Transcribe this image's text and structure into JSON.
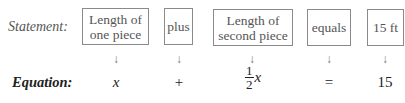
{
  "statement_label": "Statement:",
  "equation_label": "Equation:",
  "boxes": [
    {
      "line1": "Length of",
      "line2": "one piece"
    },
    {
      "line1": "plus",
      "line2": ""
    },
    {
      "line1": "Length of",
      "line2": "second piece"
    },
    {
      "line1": "equals",
      "line2": ""
    },
    {
      "line1": "15 ft",
      "line2": ""
    }
  ],
  "arrow_glyph": "↓",
  "equation": {
    "term1": "x",
    "op1": "+",
    "term2_num": "1",
    "term2_den": "2",
    "term2_var": "x",
    "op2": "=",
    "rhs": "15"
  }
}
